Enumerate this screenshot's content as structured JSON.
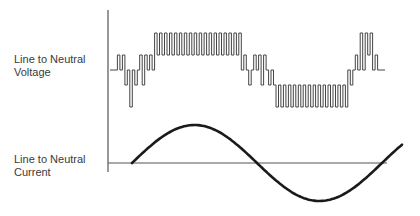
{
  "labels": {
    "voltage": "Line to Neutral\nVoltage",
    "current": "Line to Neutral\nCurrent"
  },
  "colors": {
    "axis": "#555555",
    "waveform": "#444444",
    "sine": "#1a1a1a",
    "text": "#3a3a3a"
  },
  "axis": {
    "x": 108,
    "y_top": 10,
    "y_bottom": 172,
    "baseline_y": 163,
    "baseline_x_end": 387
  },
  "voltage_waveform": {
    "x_start": 110,
    "x_end": 385,
    "level_y": {
      "+2": 33,
      "+1": 55,
      "0": 70,
      "-1": 85,
      "-2": 107
    },
    "pulse_width": 2.6,
    "segments": [
      [
        "0",
        6
      ],
      [
        "+1",
        2
      ],
      [
        "0",
        2
      ],
      [
        "+1",
        2
      ],
      [
        "-1",
        2
      ],
      [
        "0",
        2
      ],
      [
        "-2",
        2
      ],
      [
        "0",
        2
      ],
      [
        "-1",
        2
      ],
      [
        "0",
        2
      ],
      [
        "+1",
        2
      ],
      [
        "-1",
        2
      ],
      [
        "+1",
        2
      ],
      [
        "0",
        2
      ],
      [
        "+1",
        2
      ],
      [
        "0",
        2
      ],
      [
        "+2",
        2
      ],
      [
        "+1",
        2
      ],
      [
        "+2",
        2
      ],
      [
        "+1",
        2
      ],
      [
        "+2",
        2
      ],
      [
        "+1",
        2
      ],
      [
        "+2",
        2
      ],
      [
        "+1",
        2
      ],
      [
        "+2",
        2
      ],
      [
        "+1",
        2
      ],
      [
        "+2",
        2
      ],
      [
        "+1",
        2
      ],
      [
        "+2",
        2
      ],
      [
        "+1",
        2
      ],
      [
        "+2",
        2
      ],
      [
        "+1",
        2
      ],
      [
        "+2",
        2
      ],
      [
        "+1",
        2
      ],
      [
        "+2",
        2
      ],
      [
        "+1",
        2
      ],
      [
        "+2",
        2
      ],
      [
        "+1",
        2
      ],
      [
        "+2",
        2
      ],
      [
        "+1",
        2
      ],
      [
        "+2",
        2
      ],
      [
        "+1",
        2
      ],
      [
        "+2",
        2
      ],
      [
        "+1",
        2
      ],
      [
        "+2",
        2
      ],
      [
        "+1",
        2
      ],
      [
        "+2",
        2
      ],
      [
        "+1",
        2
      ],
      [
        "+2",
        2
      ],
      [
        "+1",
        2
      ],
      [
        "+2",
        2
      ],
      [
        "0",
        2
      ],
      [
        "+1",
        2
      ],
      [
        "0",
        2
      ],
      [
        "-1",
        2
      ],
      [
        "0",
        2
      ],
      [
        "+1",
        2
      ],
      [
        "0",
        2
      ],
      [
        "+1",
        2
      ],
      [
        "-1",
        2
      ],
      [
        "+1",
        2
      ],
      [
        "0",
        2
      ],
      [
        "-1",
        2
      ],
      [
        "0",
        2
      ],
      [
        "-1",
        2
      ],
      [
        "-2",
        2
      ],
      [
        "-1",
        2
      ],
      [
        "-2",
        2
      ],
      [
        "-1",
        2
      ],
      [
        "-2",
        2
      ],
      [
        "-1",
        2
      ],
      [
        "-2",
        2
      ],
      [
        "-1",
        2
      ],
      [
        "-2",
        2
      ],
      [
        "-1",
        2
      ],
      [
        "-2",
        2
      ],
      [
        "-1",
        2
      ],
      [
        "-2",
        2
      ],
      [
        "-1",
        2
      ],
      [
        "-2",
        2
      ],
      [
        "-1",
        2
      ],
      [
        "-2",
        2
      ],
      [
        "-1",
        2
      ],
      [
        "-2",
        2
      ],
      [
        "-1",
        2
      ],
      [
        "-2",
        2
      ],
      [
        "-1",
        2
      ],
      [
        "-2",
        2
      ],
      [
        "-1",
        2
      ],
      [
        "-2",
        2
      ],
      [
        "-1",
        2
      ],
      [
        "-2",
        2
      ],
      [
        "-1",
        2
      ],
      [
        "-2",
        2
      ],
      [
        "0",
        2
      ],
      [
        "-1",
        2
      ],
      [
        "0",
        2
      ],
      [
        "+1",
        2
      ],
      [
        "0",
        2
      ],
      [
        "+2",
        2
      ],
      [
        "0",
        2
      ],
      [
        "+2",
        2
      ],
      [
        "+1",
        2
      ],
      [
        "+2",
        2
      ],
      [
        "0",
        2
      ],
      [
        "+1",
        2
      ],
      [
        "0",
        6
      ]
    ]
  },
  "current_waveform": {
    "x_start": 132,
    "x_end": 403,
    "zero_y": 163,
    "amplitude": 38,
    "period_px": 250,
    "phase_start_px": 0
  }
}
